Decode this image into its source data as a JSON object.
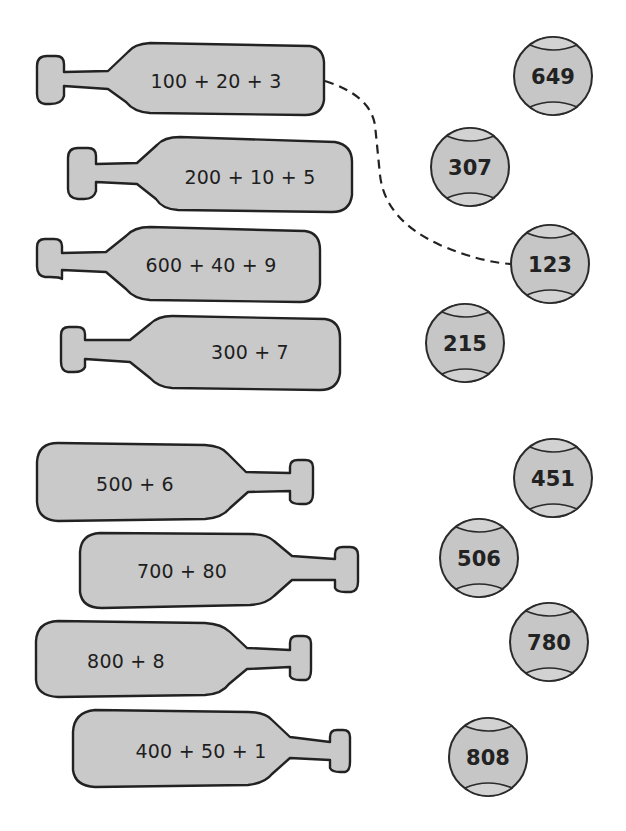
{
  "worksheet": {
    "instruction": "Match each paddle's expanded form to the ball showing its number.",
    "paddles": [
      {
        "expression": "100 + 20 + 3",
        "handle_side": "left"
      },
      {
        "expression": "200 + 10 + 5",
        "handle_side": "left"
      },
      {
        "expression": "600 + 40 + 9",
        "handle_side": "left"
      },
      {
        "expression": "300 + 7",
        "handle_side": "left"
      },
      {
        "expression": "500 + 6",
        "handle_side": "right"
      },
      {
        "expression": "700 + 80",
        "handle_side": "right"
      },
      {
        "expression": "800 + 8",
        "handle_side": "right"
      },
      {
        "expression": "400 + 50 + 1",
        "handle_side": "right"
      }
    ],
    "balls": [
      {
        "value": "649"
      },
      {
        "value": "307"
      },
      {
        "value": "123"
      },
      {
        "value": "215"
      },
      {
        "value": "451"
      },
      {
        "value": "506"
      },
      {
        "value": "780"
      },
      {
        "value": "808"
      }
    ],
    "example_connection": {
      "from": "100 + 20 + 3",
      "to": "123",
      "style": "dashed"
    },
    "colors": {
      "fill": "#c9c9c9",
      "outline": "#222222",
      "background": "#ffffff"
    }
  }
}
